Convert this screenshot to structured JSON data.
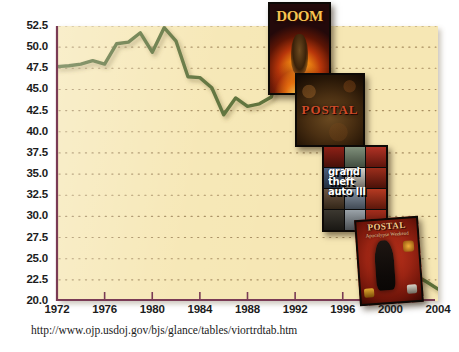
{
  "chart_data": {
    "type": "line",
    "title": "",
    "subtitle": "",
    "xlabel": "",
    "ylabel": "",
    "xlim": [
      1972,
      2004
    ],
    "ylim": [
      20.0,
      52.5
    ],
    "grid": "horizontal-dotted",
    "legend": "none",
    "background_color": "#f6e7b4",
    "line_color": "#5c7038",
    "axis_color": "#7a3b55",
    "tick_label_color": "#1c1c1c",
    "y_ticks": [
      "52.5",
      "50.0",
      "47.5",
      "45.0",
      "42.5",
      "40.0",
      "37.5",
      "35.0",
      "32.5",
      "30.0",
      "27.5",
      "25.0",
      "22.5",
      "20.0"
    ],
    "y_tick_values": [
      52.5,
      50.0,
      47.5,
      45.0,
      42.5,
      40.0,
      37.5,
      35.0,
      32.5,
      30.0,
      27.5,
      25.0,
      22.5,
      20.0
    ],
    "x_ticks": [
      "1972",
      "1976",
      "1980",
      "1984",
      "1988",
      "1992",
      "1996",
      "2000",
      "2004"
    ],
    "x_tick_values": [
      1972,
      1976,
      1980,
      1984,
      1988,
      1992,
      1996,
      2000,
      2004
    ],
    "series": [
      {
        "name": "Violent crime rate",
        "color": "#5c7038",
        "x": [
          1972,
          1973,
          1974,
          1975,
          1976,
          1977,
          1978,
          1979,
          1980,
          1981,
          1982,
          1983,
          1984,
          1985,
          1986,
          1987,
          1988,
          1989,
          1990,
          1991,
          1992,
          1993,
          1994,
          1995,
          1996,
          1997,
          1998,
          1999,
          2000,
          2001,
          2002,
          2003,
          2004
        ],
        "values": [
          47.7,
          47.8,
          48.0,
          48.4,
          48.0,
          50.4,
          50.6,
          51.7,
          49.4,
          52.3,
          50.7,
          46.5,
          46.4,
          45.2,
          42.0,
          44.0,
          43.0,
          43.3,
          44.1,
          48.7,
          51.2,
          52.2,
          51.2,
          46.1,
          41.6,
          38.8,
          36.0,
          32.1,
          27.9,
          25.1,
          23.1,
          22.3,
          21.4
        ]
      }
    ],
    "annotations": [
      {
        "label": "DOOM",
        "kind": "box-art",
        "approx_year": 1993
      },
      {
        "label": "POSTAL",
        "kind": "box-art",
        "approx_year": 1997
      },
      {
        "label": "grand theft auto III",
        "kind": "box-art",
        "approx_year": 2001
      },
      {
        "label": "POSTAL 2",
        "kind": "box-art",
        "approx_year": 2003
      }
    ]
  },
  "boxart": {
    "doom": {
      "title": "DOOM"
    },
    "postal1": {
      "title": "POSTAL"
    },
    "gta": {
      "title": "grand\ntheft\nauto III",
      "line1": "grand",
      "line2": "theft",
      "line3": "auto III"
    },
    "postal2": {
      "title": "POSTAL",
      "subtitle": "Apocalypse Weekend"
    }
  },
  "footer": {
    "source_url": "http://www.ojp.usdoj.gov/bjs/glance/tables/viortrdtab.htm"
  }
}
